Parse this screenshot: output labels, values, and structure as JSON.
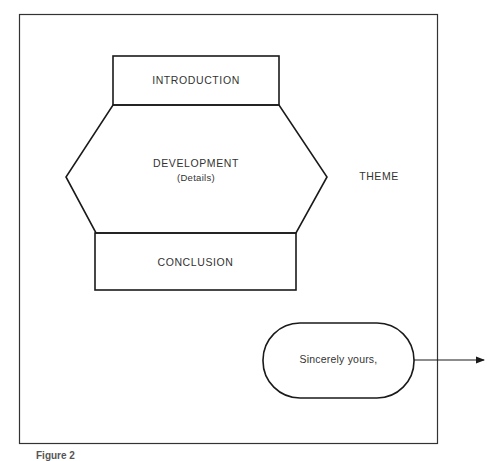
{
  "diagram": {
    "nodes": [
      {
        "id": "introduction",
        "label": "INTRODUCTION",
        "shape": "rectangle"
      },
      {
        "id": "development",
        "label": "DEVELOPMENT",
        "sublabel": "(Details)",
        "shape": "hexagon"
      },
      {
        "id": "conclusion",
        "label": "CONCLUSION",
        "shape": "rectangle"
      },
      {
        "id": "closing",
        "label": "Sincerely yours,",
        "shape": "rounded-terminal"
      }
    ],
    "side_label": "THEME",
    "arrow": {
      "from": "closing",
      "direction": "right"
    },
    "caption": "Figure 2"
  },
  "colors": {
    "stroke": "#1a1a1a",
    "text": "#333333",
    "background": "#ffffff"
  }
}
